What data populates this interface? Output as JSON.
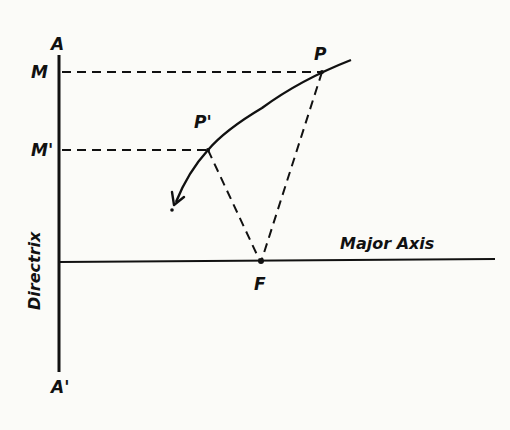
{
  "diagram": {
    "labels": {
      "A": "A",
      "A_prime": "A'",
      "M": "M",
      "M_prime": "M'",
      "P": "P",
      "P_prime": "P'",
      "F": "F",
      "directrix": "Directrix",
      "major_axis": "Major Axis"
    },
    "points": {
      "P": [
        322,
        72
      ],
      "P_prime": [
        208,
        150
      ],
      "F": [
        261,
        261
      ],
      "M": [
        60,
        72
      ],
      "M_prime": [
        60,
        150
      ]
    },
    "colors": {
      "ink": "#111111",
      "paper": "#fbfbf8"
    }
  }
}
